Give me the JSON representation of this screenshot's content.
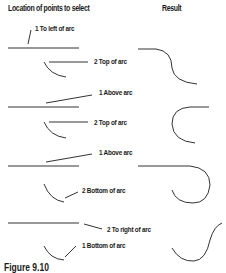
{
  "headers": {
    "left": "Location of points to select",
    "right": "Result"
  },
  "examples": [
    {
      "point1": "1 To left of arc",
      "point2": "2 Top of arc"
    },
    {
      "point1": "1 Above arc",
      "point2": "2 Top of arc"
    },
    {
      "point1": "1 Above arc",
      "point2": "2 Bottom of arc"
    },
    {
      "point1": "2 To right of arc",
      "point2": "1 Bottom of arc"
    }
  ],
  "caption": "Figure 9.10"
}
